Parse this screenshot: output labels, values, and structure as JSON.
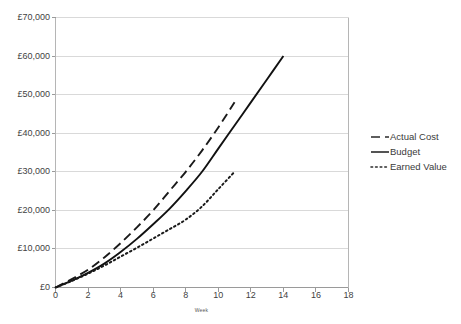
{
  "chart_data": {
    "type": "line",
    "title": "",
    "xlabel": "Week",
    "ylabel": "",
    "xlim": [
      0,
      18
    ],
    "ylim": [
      0,
      70000
    ],
    "grid": true,
    "legend_position": "right",
    "x_ticks": [
      "0",
      "2",
      "4",
      "6",
      "8",
      "10",
      "12",
      "14",
      "16",
      "18"
    ],
    "x_tick_values": [
      0,
      2,
      4,
      6,
      8,
      10,
      12,
      14,
      16,
      18
    ],
    "y_ticks": [
      "£0",
      "£10,000",
      "£20,000",
      "£30,000",
      "£40,000",
      "£50,000",
      "£60,000",
      "£70,000"
    ],
    "y_tick_values": [
      0,
      10000,
      20000,
      30000,
      40000,
      50000,
      60000,
      70000
    ],
    "currency_symbol": "£",
    "series": [
      {
        "name": "Actual Cost",
        "style": "dashed",
        "color": "#1a1a1a",
        "x": [
          0,
          1,
          2,
          3,
          4,
          5,
          6,
          7,
          8,
          9,
          10,
          11
        ],
        "values": [
          0,
          2200,
          4600,
          7800,
          11500,
          15600,
          20000,
          25000,
          30000,
          35500,
          41500,
          48000
        ]
      },
      {
        "name": "Budget",
        "style": "solid",
        "color": "#111111",
        "x": [
          0,
          1,
          2,
          3,
          4,
          5,
          6,
          7,
          8,
          9,
          10,
          11,
          12,
          13,
          14
        ],
        "values": [
          0,
          1800,
          3800,
          6200,
          9200,
          12600,
          16400,
          20400,
          25000,
          30000,
          36000,
          42000,
          48000,
          54000,
          60000
        ]
      },
      {
        "name": "Earned Value",
        "style": "dotted",
        "color": "#1a1a1a",
        "x": [
          0,
          1,
          2,
          3,
          4,
          5,
          6,
          7,
          8,
          9,
          10,
          11
        ],
        "values": [
          0,
          1700,
          3600,
          5700,
          8000,
          10300,
          12700,
          15100,
          17600,
          21000,
          25500,
          30000
        ]
      }
    ]
  },
  "legend": {
    "items": [
      {
        "label": "Actual Cost",
        "style": "dashed"
      },
      {
        "label": "Budget",
        "style": "solid"
      },
      {
        "label": "Earned Value",
        "style": "dotted"
      }
    ]
  },
  "axis": {
    "x_title": "Week"
  }
}
